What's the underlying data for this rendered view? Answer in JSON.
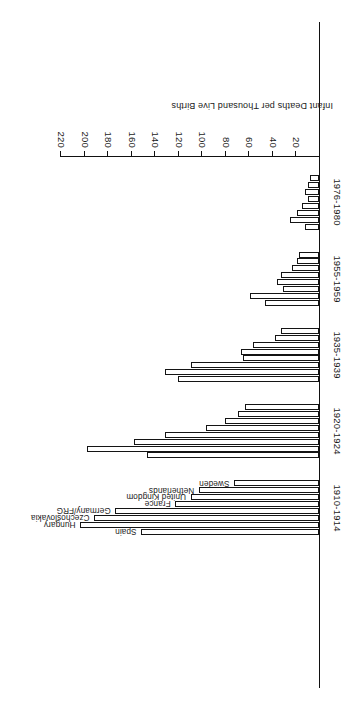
{
  "chart_data": {
    "type": "bar",
    "orientation": "horizontal",
    "title": "",
    "xlabel": "Infant Deaths per Thousand Live Births",
    "ylabel": "",
    "xlim": [
      0,
      220
    ],
    "xticks": [
      220,
      200,
      180,
      160,
      140,
      120,
      100,
      80,
      60,
      40,
      20
    ],
    "grid": false,
    "legend": "inline-labels-on-first-group",
    "note": "Axis tick labels run 220 down to 20; bars grow from the right-hand baseline toward the left.",
    "categories": [
      "1910-1914",
      "1920-1924",
      "1935-1939",
      "1955-1959",
      "1976-1980"
    ],
    "series": [
      {
        "name": "Spain",
        "values": [
          151,
          146,
          120,
          46,
          12
        ]
      },
      {
        "name": "Hungary",
        "values": [
          203,
          197,
          131,
          58,
          24
        ]
      },
      {
        "name": "Czechoslovakia",
        "values": [
          191,
          157,
          109,
          30,
          18
        ]
      },
      {
        "name": "Germany/FRG",
        "values": [
          173,
          131,
          64,
          35,
          14
        ]
      },
      {
        "name": "France",
        "values": [
          122,
          96,
          66,
          32,
          9
        ]
      },
      {
        "name": "United Kingdom",
        "values": [
          109,
          80,
          56,
          23,
          12
        ]
      },
      {
        "name": "Netherlands",
        "values": [
          102,
          69,
          37,
          18,
          9
        ]
      },
      {
        "name": "Sweden",
        "values": [
          72,
          63,
          32,
          17,
          7
        ]
      }
    ]
  },
  "axis": {
    "title": "Infant Deaths per Thousand Live Births",
    "ticks": [
      "220",
      "200",
      "180",
      "160",
      "140",
      "120",
      "100",
      "80",
      "60",
      "40",
      "20"
    ]
  },
  "groups": [
    {
      "label": "1910-1914"
    },
    {
      "label": "1920-1924"
    },
    {
      "label": "1935-1939"
    },
    {
      "label": "1955-1959"
    },
    {
      "label": "1976-1980"
    }
  ],
  "countries": [
    {
      "label": "Spain"
    },
    {
      "label": "Hungary"
    },
    {
      "label": "Czechoslovakia"
    },
    {
      "label": "Germany/FRG"
    },
    {
      "label": "France"
    },
    {
      "label": "United Kingdom"
    },
    {
      "label": "Netherlands"
    },
    {
      "label": "Sweden"
    }
  ],
  "style": {
    "bar_fill": "#ffffff",
    "bar_stroke": "#141414",
    "axis_color": "#111111",
    "background": "#ffffff"
  }
}
